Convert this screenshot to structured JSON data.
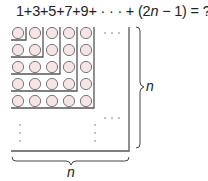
{
  "equation": {
    "prefix": "1+3+5+7+9+ · · · + (2",
    "var": "n",
    "suffix": " − 1) = ?"
  },
  "diagram": {
    "rows": 5,
    "cols": 5,
    "circle_fill": "#f6e4e6",
    "circle_stroke": "#777777",
    "line_color": "#555555",
    "horizontal_dots": "· · ·",
    "vertical_dots": "⋮"
  },
  "labels": {
    "right_brace": "n",
    "bottom_brace": "n"
  }
}
